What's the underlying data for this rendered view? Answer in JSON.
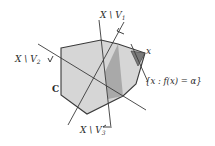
{
  "diagram": {
    "set_label": "C",
    "point_label": "x",
    "level_set_label": "{x : f(x) = α}",
    "halfspace_labels": {
      "v1": "X \\ V",
      "v1_sub": "1",
      "v2": "X \\ V",
      "v2_sub": "2",
      "v3": "X \\ V",
      "v3_sub": "3"
    },
    "colors": {
      "set_fill": "#d6d6d6",
      "set_stroke": "#3a3a3a",
      "region_fill": "#a9a9a9",
      "tip_fill": "#7a7a7a",
      "line": "#3a3a3a",
      "background": "#ffffff"
    }
  }
}
